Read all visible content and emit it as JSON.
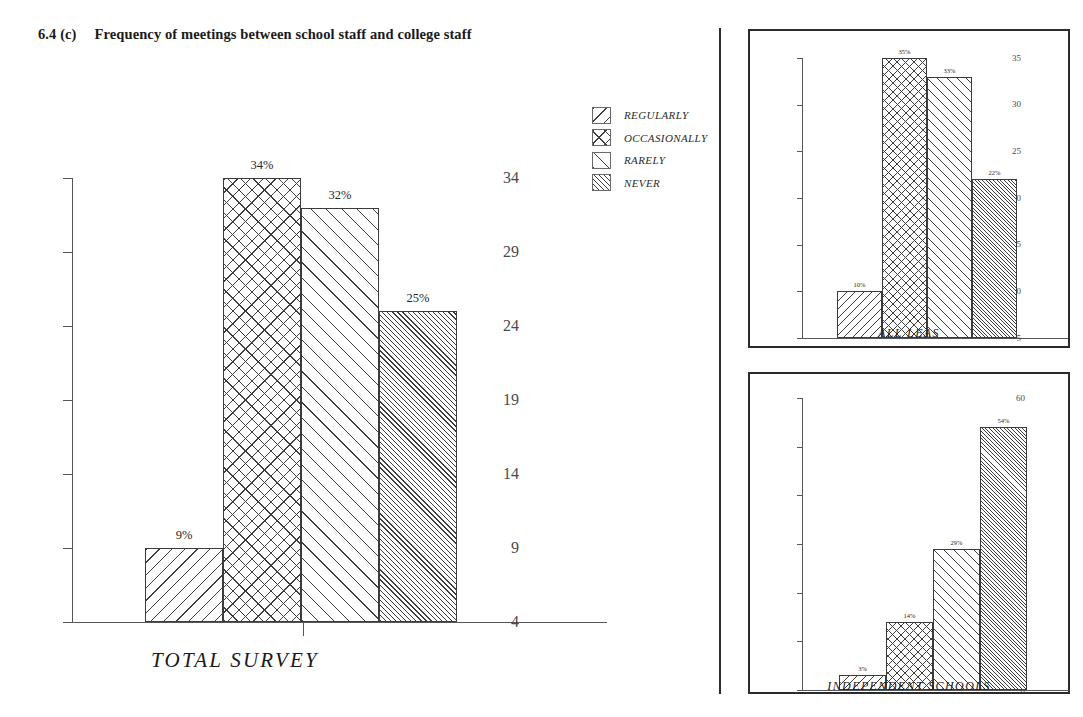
{
  "figure": {
    "number": "6.4 (c)",
    "title": "Frequency of meetings between school staff and college staff"
  },
  "legend": {
    "items": [
      {
        "label": "REGULARLY",
        "pattern": "hatch-back"
      },
      {
        "label": "OCCASIONALLY",
        "pattern": "hatch-cross"
      },
      {
        "label": "RARELY",
        "pattern": "hatch-fwd"
      },
      {
        "label": "NEVER",
        "pattern": "hatch-dense"
      }
    ]
  },
  "chart_data": [
    {
      "id": "total-survey",
      "type": "bar",
      "title": "TOTAL SURVEY",
      "xlabel": "",
      "ylabel": "",
      "categories": [
        "REGULARLY",
        "OCCASIONALLY",
        "RARELY",
        "NEVER"
      ],
      "values": [
        9,
        34,
        32,
        25
      ],
      "data_labels": [
        "9%",
        "34%",
        "32%",
        "25%"
      ],
      "yticks": [
        4,
        9,
        14,
        19,
        24,
        29,
        34
      ],
      "ytick_labels": [
        "4",
        "9",
        "14",
        "19",
        "24",
        "29",
        "34"
      ],
      "ylim": [
        4,
        34
      ],
      "grid": false,
      "legend": "external"
    },
    {
      "id": "all-leas",
      "type": "bar",
      "title": "ALL LEAS",
      "xlabel": "",
      "ylabel": "",
      "categories": [
        "REGULARLY",
        "OCCASIONALLY",
        "RARELY",
        "NEVER"
      ],
      "values": [
        10,
        35,
        33,
        22
      ],
      "data_labels": [
        "10%",
        "35%",
        "33%",
        "22%"
      ],
      "yticks": [
        5,
        10,
        15,
        20,
        25,
        30,
        35
      ],
      "ytick_labels": [
        "5",
        "10",
        "15",
        "20",
        "25",
        "30",
        "35"
      ],
      "ylim": [
        5,
        35
      ],
      "grid": false,
      "legend": "external"
    },
    {
      "id": "independent-schools",
      "type": "bar",
      "title": "INDEPENDENT SCHOOLS",
      "xlabel": "",
      "ylabel": "",
      "categories": [
        "REGULARLY",
        "OCCASIONALLY",
        "RARELY",
        "NEVER"
      ],
      "values": [
        3,
        14,
        29,
        54
      ],
      "data_labels": [
        "3%",
        "14%",
        "29%",
        "54%"
      ],
      "yticks": [
        0,
        10,
        20,
        30,
        40,
        50,
        60
      ],
      "ytick_labels": [
        "0",
        "10",
        "20",
        "30",
        "40",
        "50",
        "60"
      ],
      "ylim": [
        0,
        60
      ],
      "grid": false,
      "legend": "external"
    }
  ],
  "colors": {
    "ink": "#1a1a1a",
    "axis": "#55565a",
    "hatch": "#3d3d3d",
    "panel_border": "#2b2b2b",
    "background": "#ffffff"
  }
}
